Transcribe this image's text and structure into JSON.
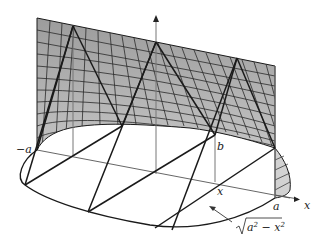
{
  "diagram": {
    "labels": {
      "neg_a": "−a",
      "a": "a",
      "b": "b",
      "x_point": "x",
      "x_axis": "x",
      "sqrt_label": "√a² − x²",
      "sqrt_radicand": "a",
      "sqrt_exp1": "2",
      "sqrt_minus": " − x",
      "sqrt_exp2": "2"
    },
    "colors": {
      "surface_fill": "#a9a9a9",
      "grid_line": "#2a2a2a",
      "edge_line": "#1a1a1a",
      "axis_line": "#777777"
    }
  }
}
